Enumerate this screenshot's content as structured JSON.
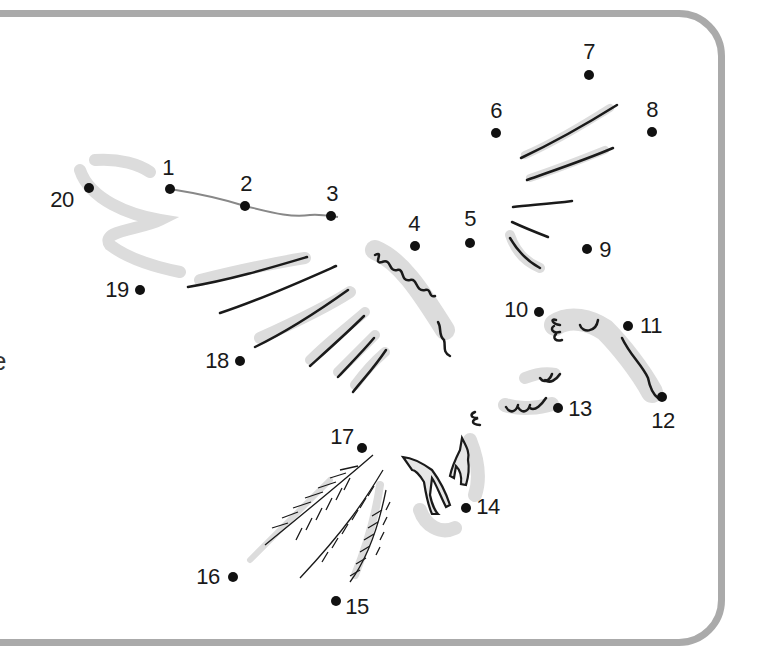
{
  "worksheet": {
    "type": "connect-the-dots",
    "subject": "flying bird (eagle)",
    "edge_text_fragment": "e",
    "frame_color": "#aaaaaa",
    "connected_line_color": "#888888",
    "connected_segments": [
      [
        1,
        2
      ],
      [
        2,
        3
      ]
    ],
    "dots": [
      {
        "n": "1",
        "x": 170,
        "y": 189,
        "lx": 168,
        "ly": 168
      },
      {
        "n": "2",
        "x": 245,
        "y": 206,
        "lx": 246,
        "ly": 184
      },
      {
        "n": "3",
        "x": 331,
        "y": 216,
        "lx": 332,
        "ly": 194
      },
      {
        "n": "4",
        "x": 415,
        "y": 246,
        "lx": 414,
        "ly": 224
      },
      {
        "n": "5",
        "x": 470,
        "y": 243,
        "lx": 470,
        "ly": 219
      },
      {
        "n": "6",
        "x": 496,
        "y": 133,
        "lx": 496,
        "ly": 111
      },
      {
        "n": "7",
        "x": 589,
        "y": 75,
        "lx": 589,
        "ly": 52
      },
      {
        "n": "8",
        "x": 652,
        "y": 132,
        "lx": 652,
        "ly": 110
      },
      {
        "n": "9",
        "x": 587,
        "y": 249,
        "lx": 605,
        "ly": 250
      },
      {
        "n": "10",
        "x": 539,
        "y": 312,
        "lx": 516,
        "ly": 310
      },
      {
        "n": "11",
        "x": 628,
        "y": 326,
        "lx": 651,
        "ly": 326
      },
      {
        "n": "12",
        "x": 662,
        "y": 397,
        "lx": 663,
        "ly": 421
      },
      {
        "n": "13",
        "x": 558,
        "y": 408,
        "lx": 580,
        "ly": 409
      },
      {
        "n": "14",
        "x": 466,
        "y": 508,
        "lx": 488,
        "ly": 507
      },
      {
        "n": "15",
        "x": 336,
        "y": 601,
        "lx": 357,
        "ly": 607
      },
      {
        "n": "16",
        "x": 233,
        "y": 577,
        "lx": 208,
        "ly": 577
      },
      {
        "n": "17",
        "x": 362,
        "y": 448,
        "lx": 342,
        "ly": 437
      },
      {
        "n": "18",
        "x": 240,
        "y": 361,
        "lx": 217,
        "ly": 361
      },
      {
        "n": "19",
        "x": 140,
        "y": 290,
        "lx": 117,
        "ly": 290
      },
      {
        "n": "20",
        "x": 89,
        "y": 188,
        "lx": 62,
        "ly": 200
      }
    ]
  }
}
